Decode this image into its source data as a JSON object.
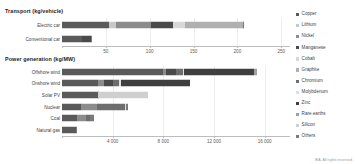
{
  "copyright": "IEA. All rights reserved.",
  "legend": {
    "position": "right",
    "items": [
      {
        "label": "Copper",
        "color": "#5a5a5a"
      },
      {
        "label": "Lithium",
        "color": "#c8c8c8"
      },
      {
        "label": "Nickel",
        "color": "#8c8c8c"
      },
      {
        "label": "Manganese",
        "color": "#4a4a4a"
      },
      {
        "label": "Cobalt",
        "color": "#d8d8d8"
      },
      {
        "label": "Graphite",
        "color": "#b0b0b0"
      },
      {
        "label": "Chromium",
        "color": "#6e6e6e"
      },
      {
        "label": "Molybdenum",
        "color": "#e0e0e0"
      },
      {
        "label": "Zinc",
        "color": "#3f3f3f"
      },
      {
        "label": "Rare earths",
        "color": "#a0a0a0"
      },
      {
        "label": "Silicon",
        "color": "#cfcfcf"
      },
      {
        "label": "Others",
        "color": "#7a7a7a"
      }
    ]
  },
  "chart_data": {
    "type": "bar",
    "subtype": "stacked-horizontal",
    "title": "",
    "grid": true,
    "series_names": [
      "Copper",
      "Lithium",
      "Nickel",
      "Manganese",
      "Cobalt",
      "Graphite",
      "Chromium",
      "Molybdenum",
      "Zinc",
      "Rare earths",
      "Silicon",
      "Others"
    ],
    "panels": [
      {
        "title": "Transport (kg/vehicle)",
        "xlabel": "",
        "ylabel": "",
        "xlim": [
          0,
          260
        ],
        "ticks": [
          0,
          50,
          100,
          150,
          200,
          250
        ],
        "tick_labels": [
          "",
          "50",
          "100",
          "150",
          "200",
          "250"
        ],
        "categories": [
          "Electric car",
          "Conventional car"
        ],
        "rows": [
          {
            "category": "Electric car",
            "total": 207,
            "values": [
              53.2,
              8.9,
              39.9,
              24.5,
              13.3,
              66.3,
              0,
              0,
              0,
              0.5,
              0,
              0.4
            ]
          },
          {
            "category": "Conventional car",
            "total": 34,
            "values": [
              22.3,
              0,
              0,
              11.2,
              0,
              0,
              0,
              0,
              0,
              0,
              0,
              0.5
            ]
          }
        ]
      },
      {
        "title": "Power generation (kg/MW)",
        "xlabel": "",
        "ylabel": "",
        "xlim": [
          0,
          18000
        ],
        "ticks": [
          0,
          4000,
          8000,
          12000,
          16000
        ],
        "tick_labels": [
          "",
          "4 000",
          "8 000",
          "12 000",
          "16 000"
        ],
        "categories": [
          "Offshore wind",
          "Onshore wind",
          "Solar PV",
          "Nuclear",
          "Coal",
          "Natural gas"
        ],
        "rows": [
          {
            "category": "Offshore wind",
            "total": 15400,
            "values": [
              8000,
              0,
              240,
              790,
              0,
              0,
              525,
              109,
              5500,
              239,
              0,
              0
            ]
          },
          {
            "category": "Onshore wind",
            "total": 10100,
            "values": [
              2900,
              0,
              404,
              780,
              0,
              0,
              470,
              99,
              5500,
              14,
              0,
              0
            ]
          },
          {
            "category": "Solar PV",
            "total": 6800,
            "values": [
              2822,
              0,
              0,
              0,
              0,
              0,
              0,
              0,
              30,
              0,
              3948,
              0
            ]
          },
          {
            "category": "Nuclear",
            "total": 5200,
            "values": [
              1473,
              0,
              1300,
              0,
              0,
              0,
              2189,
              69,
              0,
              0,
              0,
              169
            ]
          },
          {
            "category": "Coal",
            "total": 2500,
            "values": [
              1150,
              0,
              721,
              0,
              0,
              0,
              313,
              66,
              0,
              0,
              0,
              250
            ]
          },
          {
            "category": "Natural gas",
            "total": 1200,
            "values": [
              1100,
              0,
              0,
              0,
              0,
              0,
              0,
              0,
              0,
              0,
              0,
              100
            ]
          }
        ]
      }
    ]
  }
}
